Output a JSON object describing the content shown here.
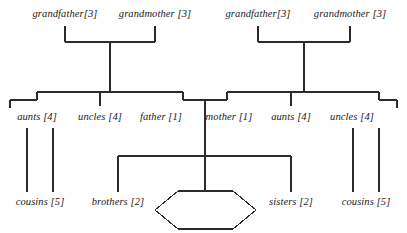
{
  "diagram": {
    "type": "family-tree",
    "colors": {
      "line": "#2b2b2b",
      "text": "#1a1a1a",
      "background": "#ffffff"
    },
    "generations": [
      {
        "name": "grandparents",
        "nodes": [
          {
            "id": "gf-left",
            "label": "grandfather[3]",
            "count": 3,
            "x": 65,
            "y": 14
          },
          {
            "id": "gm-left",
            "label": "grandmother [3]",
            "count": 3,
            "x": 155,
            "y": 14
          },
          {
            "id": "gf-right",
            "label": "grandfather[3]",
            "count": 3,
            "x": 258,
            "y": 14
          },
          {
            "id": "gm-right",
            "label": "grandmother [3]",
            "count": 3,
            "x": 350,
            "y": 14
          }
        ]
      },
      {
        "name": "parents",
        "nodes": [
          {
            "id": "aunts-left",
            "label": "aunts [4]",
            "count": 4,
            "x": 37,
            "y": 117
          },
          {
            "id": "uncles-left",
            "label": "uncles [4]",
            "count": 4,
            "x": 100,
            "y": 117
          },
          {
            "id": "father",
            "label": "father [1]",
            "count": 1,
            "x": 161,
            "y": 117
          },
          {
            "id": "mother",
            "label": "mother [1]",
            "count": 1,
            "x": 229,
            "y": 117
          },
          {
            "id": "aunts-right",
            "label": "aunts [4]",
            "count": 4,
            "x": 291,
            "y": 117
          },
          {
            "id": "uncles-right",
            "label": "uncles [4]",
            "count": 4,
            "x": 352,
            "y": 117
          }
        ]
      },
      {
        "name": "children",
        "nodes": [
          {
            "id": "cousins-left",
            "label": "cousins [5]",
            "count": 5,
            "x": 40,
            "y": 202
          },
          {
            "id": "brothers",
            "label": "brothers [2]",
            "count": 2,
            "x": 118,
            "y": 202
          },
          {
            "id": "self",
            "label": "",
            "count": 1,
            "x": 205,
            "y": 210,
            "shape": "hexagon"
          },
          {
            "id": "sisters",
            "label": "sisters [2]",
            "count": 2,
            "x": 291,
            "y": 202
          },
          {
            "id": "cousins-right",
            "label": "cousins [5]",
            "count": 5,
            "x": 366,
            "y": 202
          }
        ]
      }
    ]
  }
}
